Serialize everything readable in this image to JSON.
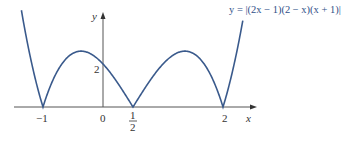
{
  "chart_data": {
    "type": "line",
    "title": "y = |(2x − 1)(2 − x)(x + 1)|",
    "xlabel": "x",
    "ylabel": "y",
    "x_ticks": [
      "-1",
      "0",
      "1/2",
      "2"
    ],
    "y_ticks": [
      "2"
    ],
    "xlim": [
      -1.5,
      2.5
    ],
    "ylim": [
      0,
      4.5
    ],
    "grid": false,
    "series": [
      {
        "name": "y = |(2x − 1)(2 − x)(x + 1)|",
        "color": "#3a5a8c",
        "x": [
          -1.35,
          -1.2,
          -1.0,
          -0.8,
          -0.6,
          -0.37,
          -0.2,
          0.0,
          0.25,
          0.5,
          0.75,
          1.0,
          1.25,
          1.37,
          1.5,
          1.75,
          2.0,
          2.2,
          2.32
        ],
        "values": [
          4.34,
          1.91,
          0.0,
          1.85,
          2.42,
          2.63,
          2.3,
          2.0,
          1.22,
          0.0,
          1.53,
          2.0,
          2.53,
          2.63,
          2.5,
          2.06,
          0.0,
          2.53,
          4.34
        ]
      }
    ],
    "annotations": [
      "2 (y-intercept)",
      "zeros at x = -1, 1/2, 2"
    ]
  },
  "labels": {
    "equation": "y = |(2x − 1)(2 − x)(x + 1)|",
    "x_axis": "x",
    "y_axis": "y",
    "tick_neg1": "−1",
    "tick_0": "0",
    "tick_half_num": "1",
    "tick_half_den": "2",
    "tick_2": "2",
    "y_tick_2": "2"
  }
}
